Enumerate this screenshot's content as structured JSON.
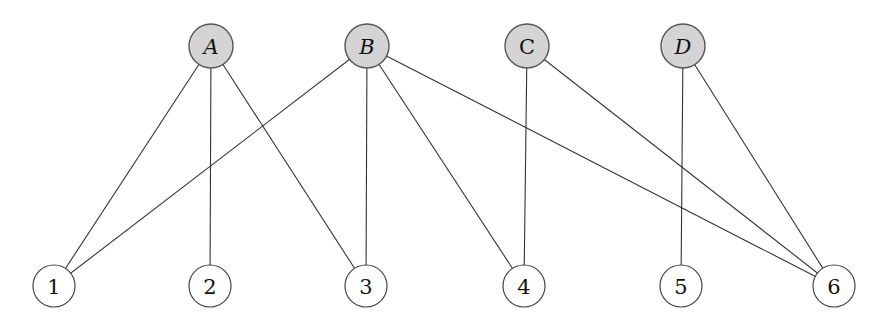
{
  "diagram": {
    "type": "bipartite-graph",
    "colors": {
      "top_node_fill": "#d4d4d4",
      "bottom_node_fill": "#ffffff",
      "edge": "#333333"
    },
    "top_nodes": [
      {
        "id": "A",
        "label": "A",
        "italic": true,
        "x": 211,
        "y": 46
      },
      {
        "id": "B",
        "label": "B",
        "italic": true,
        "x": 367,
        "y": 46
      },
      {
        "id": "C",
        "label": "C",
        "italic": false,
        "x": 527,
        "y": 46
      },
      {
        "id": "D",
        "label": "D",
        "italic": true,
        "x": 683,
        "y": 46
      }
    ],
    "bottom_nodes": [
      {
        "id": "1",
        "label": "1",
        "x": 54,
        "y": 286
      },
      {
        "id": "2",
        "label": "2",
        "x": 210,
        "y": 286
      },
      {
        "id": "3",
        "label": "3",
        "x": 366,
        "y": 286
      },
      {
        "id": "4",
        "label": "4",
        "x": 524,
        "y": 286
      },
      {
        "id": "5",
        "label": "5",
        "x": 681,
        "y": 286
      },
      {
        "id": "6",
        "label": "6",
        "x": 834,
        "y": 286
      }
    ],
    "edges": [
      [
        "A",
        "1"
      ],
      [
        "A",
        "2"
      ],
      [
        "A",
        "3"
      ],
      [
        "B",
        "1"
      ],
      [
        "B",
        "3"
      ],
      [
        "B",
        "4"
      ],
      [
        "B",
        "6"
      ],
      [
        "C",
        "4"
      ],
      [
        "C",
        "6"
      ],
      [
        "D",
        "5"
      ],
      [
        "D",
        "6"
      ]
    ]
  }
}
